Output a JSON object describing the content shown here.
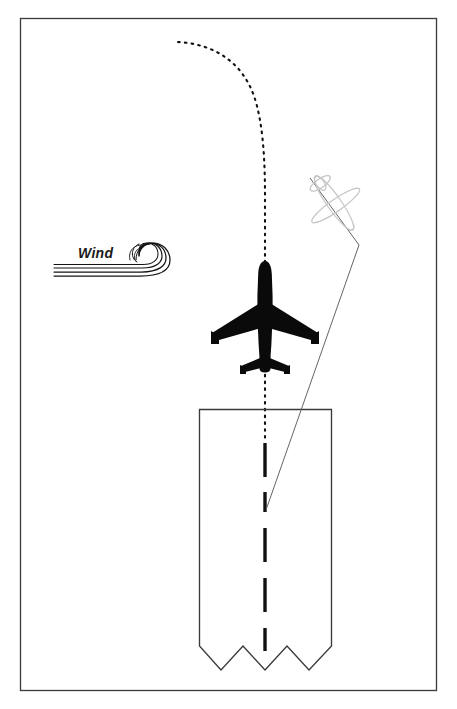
{
  "figure": {
    "name": "crosswind-landing-approach-diagram",
    "background_color": "#ffffff",
    "frame": {
      "name": "figure-border",
      "stroke_color": "#3a3a3a",
      "stroke_width": 1.2,
      "x": 20,
      "y": 18,
      "width": 416,
      "height": 672
    }
  },
  "labels": {
    "wind": "Wind"
  },
  "colors": {
    "ink": "#111111",
    "line": "#3a3a3a",
    "ghost_plane": "#bfbfbf",
    "dotted_track": "#1a1a1a",
    "runway_edge": "#3a3a3a",
    "centerline": "#111111",
    "background": "#ffffff"
  },
  "elements": {
    "wind_symbol": {
      "name": "wind-swirl-icon",
      "center_x": 148,
      "center_y": 262,
      "streak_count": 4,
      "streak_start_x": 54,
      "stroke_color": "#1a1a1a"
    },
    "main_aircraft": {
      "name": "jet-aircraft-silhouette",
      "center_x": 265,
      "center_y": 318,
      "heading_degrees": 0,
      "wingspan_px": 108,
      "length_px": 116,
      "fill": "#0a0a0a"
    },
    "ghost_aircraft": {
      "name": "ghost-aircraft-symbol",
      "center_x": 334,
      "center_y": 203,
      "heading_degrees": 152,
      "stroke_color": "#c3c3c3",
      "span_px": 56
    },
    "reference_line": {
      "name": "approach-reference-line",
      "stroke_color": "#555555",
      "points": [
        [
          310,
          178
        ],
        [
          359,
          244
        ],
        [
          266,
          510
        ]
      ]
    },
    "dotted_track": {
      "name": "dotted-ground-track",
      "dash_pattern": "2 5",
      "stroke_color": "#111111",
      "start": [
        178,
        42
      ],
      "end": [
        265,
        440
      ]
    },
    "runway": {
      "name": "runway-outline",
      "left_x": 199,
      "right_x": 331,
      "top_y": 409,
      "break_y": 645,
      "bottom_y": 672,
      "stroke_color": "#3a3a3a",
      "zigzag_peaks": 4
    },
    "runway_centerline": {
      "name": "runway-centerline-dashes",
      "x": 265,
      "top_y": 443,
      "bottom_y": 648,
      "dash_length": 34,
      "gap_length": 15,
      "stroke_color": "#111111",
      "stroke_width": 3.4
    }
  }
}
